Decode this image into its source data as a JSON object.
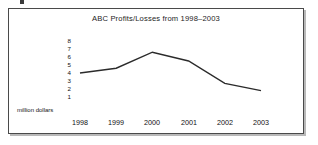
{
  "chart_data": {
    "type": "line",
    "title": "ABC Profits/Losses from 1998–2003",
    "xlabel": "",
    "ylabel": "million dollars",
    "categories": [
      "1998",
      "1999",
      "2000",
      "2001",
      "2002",
      "2003"
    ],
    "values": [
      4.0,
      4.6,
      6.6,
      5.5,
      2.7,
      1.8
    ],
    "series": [
      {
        "name": "ABC Profits/Losses",
        "values": [
          4.0,
          4.6,
          6.6,
          5.5,
          2.7,
          1.8
        ]
      }
    ],
    "y_tick_labels": [
      "8",
      "7",
      "6",
      "5",
      "4",
      "3",
      "2",
      "1"
    ],
    "ylim": [
      0,
      8
    ],
    "grid": false,
    "legend": false,
    "legend_position": "none",
    "line_color": "#2b2b2b",
    "markers": false
  },
  "frame": {
    "border_color": "#4a4a4a",
    "shadow_color": "#b9b9b9",
    "background": "#ffffff"
  }
}
